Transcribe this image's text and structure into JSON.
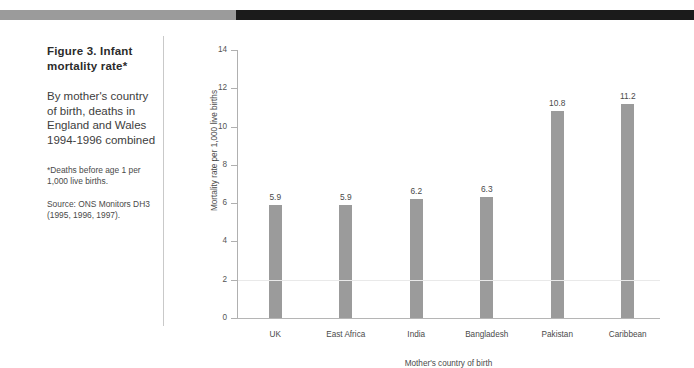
{
  "figure": {
    "top_rule": {
      "gray_color": "#9b9b9b",
      "black_color": "#1b1b1b"
    },
    "caption_title": "Figure 3. Infant mortality rate*",
    "caption_description": "By mother's country of birth, deaths in England and Wales 1994-1996 combined",
    "footnote": "*Deaths before age 1 per 1,000 live births.",
    "source": "Source: ONS Monitors DH3 (1995, 1996, 1997)."
  },
  "chart_data": {
    "type": "bar",
    "title": "Figure 3. Infant mortality rate*",
    "subtitle": "By mother's country of birth, deaths in England and Wales 1994-1996 combined",
    "categories": [
      "UK",
      "East Africa",
      "India",
      "Bangladesh",
      "Pakistan",
      "Caribbean"
    ],
    "values": [
      5.9,
      5.9,
      6.2,
      6.3,
      10.8,
      11.2
    ],
    "value_labels": [
      "5.9",
      "5.9",
      "6.2",
      "6.3",
      "10.8",
      "11.2"
    ],
    "xlabel": "Mother's country of birth",
    "ylabel": "Mortality rate per 1,000 live births",
    "ylim": [
      0,
      14
    ],
    "yticks": [
      0,
      2,
      4,
      6,
      8,
      10,
      12,
      14
    ],
    "ytick_labels": [
      "0",
      "2",
      "4",
      "6",
      "8",
      "10",
      "12",
      "14"
    ],
    "grid": false,
    "legend": null,
    "bar_color": "#9b9b9b"
  }
}
